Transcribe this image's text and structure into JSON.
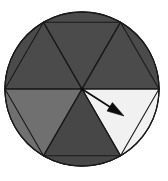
{
  "figure": {
    "name": "spinner-wheel",
    "background_color": "#ffffff",
    "outline_color": "#1a1a1a"
  },
  "wheel": {
    "center_x": 82,
    "center_y": 89,
    "radius": 77,
    "sector_count": 6,
    "sector_angle_degrees": 60,
    "sectors": [
      {
        "index": 1,
        "name": "sector-upper-left",
        "shade": "dark gray",
        "color": "#4b4b4b",
        "start_angle": 180,
        "end_angle": 240
      },
      {
        "index": 2,
        "name": "sector-top",
        "shade": "dark gray",
        "color": "#4b4b4b",
        "start_angle": 240,
        "end_angle": 300
      },
      {
        "index": 3,
        "name": "sector-upper-right",
        "shade": "dark gray",
        "color": "#4b4b4b",
        "start_angle": 300,
        "end_angle": 360
      },
      {
        "index": 4,
        "name": "sector-lower-right",
        "shade": "white",
        "color": "#f1f1f1",
        "start_angle": 0,
        "end_angle": 60
      },
      {
        "index": 5,
        "name": "sector-bottom",
        "shade": "dark gray",
        "color": "#474747",
        "start_angle": 60,
        "end_angle": 120
      },
      {
        "index": 6,
        "name": "sector-lower-left",
        "shade": "medium gray",
        "color": "#707070",
        "start_angle": 120,
        "end_angle": 180
      }
    ]
  },
  "pointer": {
    "name": "spinner-pointer",
    "tail_x": 82,
    "tail_y": 89,
    "tip_x": 124,
    "tip_y": 116,
    "angle_degrees": 33,
    "points_to_sector": "sector-lower-right",
    "color": "#0d0d0d"
  },
  "chart_data": {
    "type": "pie",
    "categories": [
      "sector-upper-left",
      "sector-top",
      "sector-upper-right",
      "sector-lower-right",
      "sector-bottom",
      "sector-lower-left"
    ],
    "values": [
      60,
      60,
      60,
      60,
      60,
      60
    ],
    "value_unit": "degrees",
    "colors": [
      "#4b4b4b",
      "#4b4b4b",
      "#4b4b4b",
      "#f1f1f1",
      "#474747",
      "#707070"
    ],
    "legend": "none",
    "annotations": [
      "pointer arrow from center into the white lower-right sector"
    ]
  }
}
